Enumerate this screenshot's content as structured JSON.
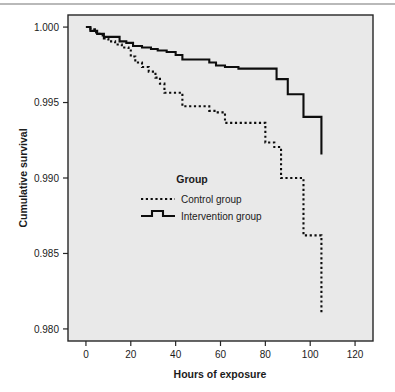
{
  "chart_data": {
    "type": "line",
    "title": "",
    "subtitle": "",
    "xlabel": "Hours of exposure",
    "ylabel": "Cumulative survival",
    "xlim": [
      -8,
      128
    ],
    "ylim": [
      0.9792,
      1.0008
    ],
    "xticks": [
      0,
      20,
      40,
      60,
      80,
      100,
      120
    ],
    "xtick_labels": [
      "0",
      "20",
      "40",
      "60",
      "80",
      "100",
      "120"
    ],
    "yticks": [
      1.0,
      0.995,
      0.99,
      0.985,
      0.98
    ],
    "ytick_labels": [
      "1.000",
      "0.995",
      "0.990",
      "0.985",
      "0.980"
    ],
    "grid": false,
    "plot_background": "#e9e9e9",
    "axis_color": "#262626",
    "line_color": "#0d0d0d",
    "legend": {
      "position": "inside-center-left",
      "title": "Group",
      "entries": [
        {
          "name": "Control group",
          "style": "dotted"
        },
        {
          "name": "Intervention group",
          "style": "solid"
        }
      ]
    },
    "series": [
      {
        "name": "Control group",
        "style": "dotted",
        "step": "post",
        "x": [
          0,
          2,
          4,
          6,
          8,
          10,
          13,
          16,
          19,
          20,
          22,
          25,
          28,
          31,
          33,
          35,
          38,
          41,
          43,
          46,
          50,
          55,
          58,
          62,
          66,
          72,
          78,
          80,
          84,
          87,
          92,
          97,
          100,
          104,
          105
        ],
        "y": [
          1.0,
          0.99985,
          0.99965,
          0.99945,
          0.99925,
          0.99905,
          0.99885,
          0.99865,
          0.99845,
          0.99805,
          0.99765,
          0.99735,
          0.99705,
          0.99665,
          0.99625,
          0.99565,
          0.99565,
          0.99565,
          0.99475,
          0.99475,
          0.99475,
          0.99445,
          0.99435,
          0.99365,
          0.99365,
          0.99365,
          0.99365,
          0.99235,
          0.99205,
          0.99,
          0.99,
          0.9862,
          0.9862,
          0.9862,
          0.98105
        ]
      },
      {
        "name": "Intervention group",
        "style": "solid",
        "step": "post",
        "x": [
          0,
          2,
          5,
          8,
          11,
          15,
          18,
          21,
          25,
          29,
          32,
          36,
          40,
          43,
          46,
          50,
          55,
          58,
          62,
          68,
          74,
          80,
          85,
          87,
          90,
          94,
          97,
          100,
          104,
          105
        ],
        "y": [
          1.0,
          0.99975,
          0.99955,
          0.99935,
          0.99935,
          0.99905,
          0.99895,
          0.99875,
          0.99865,
          0.99855,
          0.99845,
          0.99835,
          0.99815,
          0.99785,
          0.99785,
          0.99785,
          0.99765,
          0.99745,
          0.99735,
          0.99725,
          0.99725,
          0.99725,
          0.99655,
          0.99655,
          0.99555,
          0.99555,
          0.99405,
          0.99405,
          0.99405,
          0.99155
        ]
      }
    ]
  }
}
